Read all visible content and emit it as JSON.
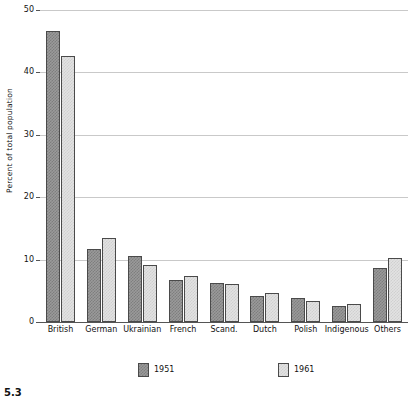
{
  "figure": {
    "number": "5.3"
  },
  "chart_data": {
    "type": "bar",
    "title": "",
    "xlabel": "",
    "ylabel": "Percent of total population",
    "ylim": [
      0,
      50
    ],
    "yticks": [
      0,
      10,
      20,
      30,
      40,
      50
    ],
    "ytick_labels": [
      "0",
      "10",
      "20",
      "30",
      "40",
      "50"
    ],
    "grid": true,
    "legend_position": "bottom",
    "categories": [
      "British",
      "German",
      "Ukrainian",
      "French",
      "Scand.",
      "Dutch",
      "Polish",
      "Indigenous",
      "Others"
    ],
    "series": [
      {
        "name": "1951",
        "color": "#9a9a9a",
        "values": [
          46.6,
          11.7,
          10.5,
          6.8,
          6.3,
          4.2,
          3.8,
          2.5,
          8.7
        ]
      },
      {
        "name": "1961",
        "color": "#e2e2e2",
        "values": [
          42.6,
          13.5,
          9.2,
          7.3,
          6.1,
          4.7,
          3.4,
          2.9,
          10.2
        ]
      }
    ]
  },
  "legend": {
    "items": [
      {
        "label": "1951"
      },
      {
        "label": "1961"
      }
    ]
  },
  "colors": {
    "series_1951": "#9a9a9a",
    "series_1961": "#e2e2e2",
    "bar_outline": "#4a4a4a",
    "gridline": "#c9c9c9",
    "axis": "#555555",
    "text": "#111111"
  }
}
